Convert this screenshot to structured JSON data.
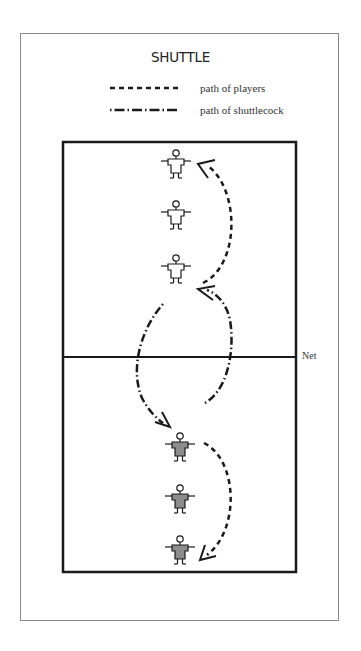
{
  "title": "SHUTTLE",
  "legend": [
    {
      "style": "dashed",
      "label": "path of players"
    },
    {
      "style": "dash-dot",
      "label": "path of shuttlecock"
    }
  ],
  "court": {
    "net_label": "Net",
    "line_color": "#1a1a1a"
  },
  "players": {
    "team_top": {
      "fill": "#ffffff",
      "count": 3
    },
    "team_bottom": {
      "fill": "#8c8c8c",
      "count": 3
    }
  },
  "colors": {
    "frame": "#8a8a8a",
    "ink": "#1a1a1a"
  }
}
